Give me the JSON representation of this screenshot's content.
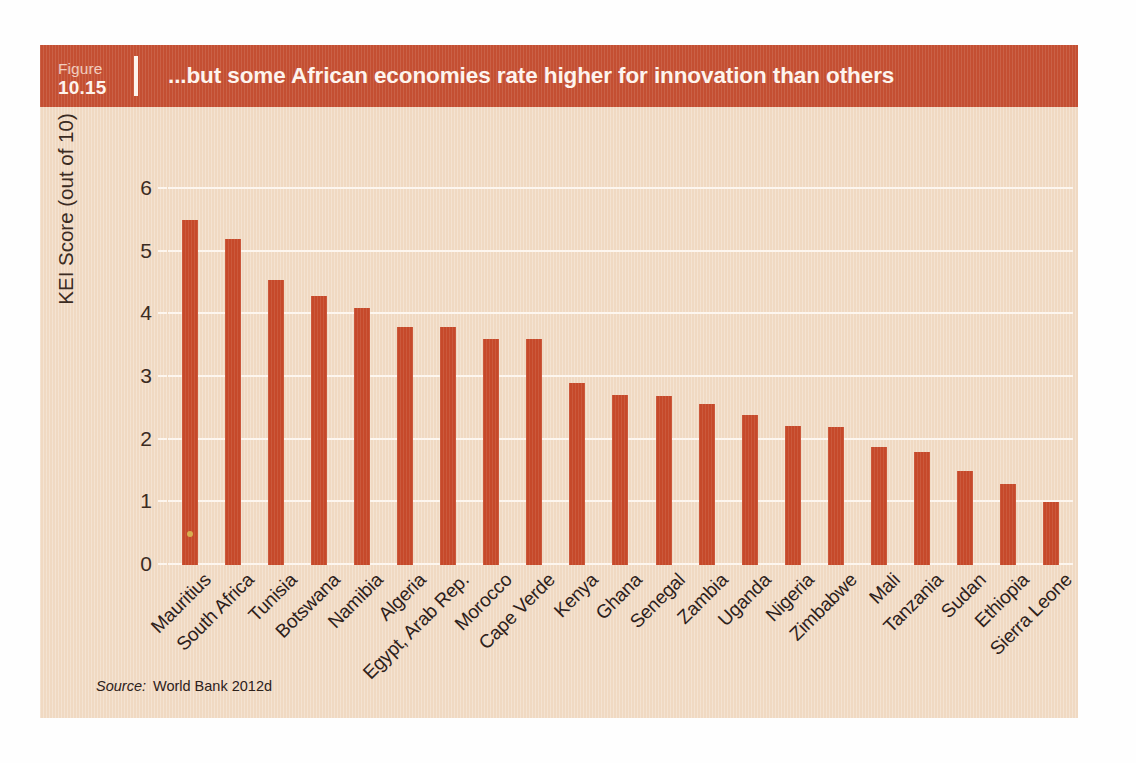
{
  "figure": {
    "label": "Figure",
    "number": "10.15",
    "title": "...but some African economies rate higher for innovation than others"
  },
  "source": {
    "keyword": "Source:",
    "value": "World Bank 2012d"
  },
  "colors": {
    "bar": "#c6492a",
    "header_band": "#c44f32",
    "panel_background": "#f0d9c2",
    "gridline": "#fdf6ef",
    "header_text": "#fdf4ee",
    "axis_text": "#2d211b"
  },
  "chart_data": {
    "type": "bar",
    "title": "...but some African economies rate higher for innovation than others",
    "xlabel": "",
    "ylabel": "KEI Score (out of 10)",
    "ylim": [
      0,
      6
    ],
    "yticks": [
      0,
      1,
      2,
      3,
      4,
      5,
      6
    ],
    "ytick_labels": [
      "0",
      "1",
      "2",
      "3",
      "4",
      "5",
      "6"
    ],
    "grid": true,
    "legend": false,
    "orientation": "vertical",
    "categories": [
      "Mauritius",
      "South Africa",
      "Tunisia",
      "Botswana",
      "Namibia",
      "Algeria",
      "Egypt, Arab Rep.",
      "Morocco",
      "Cape Verde",
      "Kenya",
      "Ghana",
      "Senegal",
      "Zambia",
      "Uganda",
      "Nigeria",
      "Zimbabwe",
      "Mali",
      "Tanzania",
      "Sudan",
      "Ethiopia",
      "Sierra Leone"
    ],
    "values": [
      5.5,
      5.2,
      4.55,
      4.3,
      4.1,
      3.8,
      3.8,
      3.6,
      3.6,
      2.9,
      2.72,
      2.7,
      2.57,
      2.4,
      2.22,
      2.2,
      1.88,
      1.8,
      1.5,
      1.3,
      1.0
    ],
    "series": [
      {
        "name": "KEI Score",
        "values": [
          5.5,
          5.2,
          4.55,
          4.3,
          4.1,
          3.8,
          3.8,
          3.6,
          3.6,
          2.9,
          2.72,
          2.7,
          2.57,
          2.4,
          2.22,
          2.2,
          1.88,
          1.8,
          1.5,
          1.3,
          1.0
        ]
      }
    ]
  }
}
